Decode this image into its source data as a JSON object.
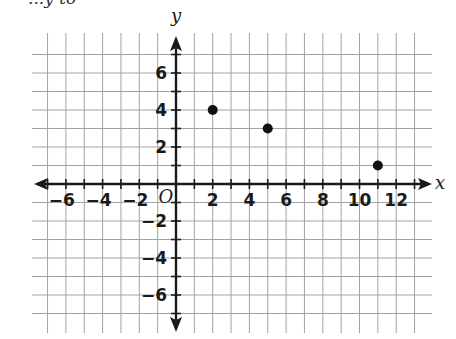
{
  "header": {
    "cut_text": "...y to"
  },
  "chart_data": {
    "type": "scatter",
    "title": "",
    "xlabel": "x",
    "ylabel": "y",
    "origin_label": "O",
    "xlim": [
      -7,
      13
    ],
    "ylim": [
      -7,
      7
    ],
    "grid": true,
    "x_ticks": [
      -6,
      -4,
      -2,
      2,
      4,
      6,
      8,
      10,
      12
    ],
    "y_ticks": [
      6,
      4,
      2,
      -2,
      -4,
      -6
    ],
    "points": [
      {
        "x": 2,
        "y": 4
      },
      {
        "x": 5,
        "y": 3
      },
      {
        "x": 11,
        "y": 1
      }
    ],
    "point_color": "#111111",
    "grid_color": "#a3a3a3",
    "axis_color": "#1a1a1a"
  }
}
